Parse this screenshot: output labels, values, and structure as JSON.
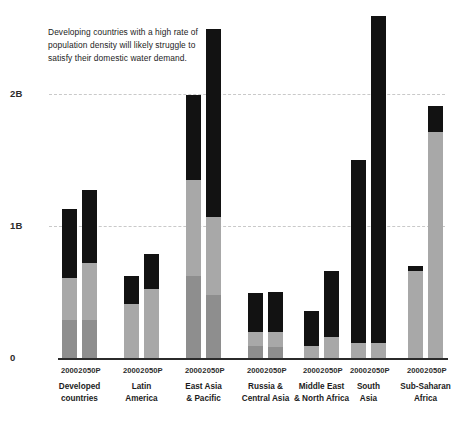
{
  "annotation": {
    "line1": "Developing countries with a high rate of",
    "line2": "population density will likely struggle to",
    "line3": "satisfy their domestic water demand."
  },
  "axis": {
    "y_ticks": [
      "2B",
      "1B",
      "0"
    ],
    "tick_2b": "2B",
    "tick_1b": "1B",
    "tick_0": "0"
  },
  "series_labels": {
    "year_2000": "2000",
    "year_2050": "2050P"
  },
  "chart_data": {
    "type": "bar",
    "subtype": "stacked-grouped",
    "title": "",
    "subtitle": "",
    "annotation": "Developing countries with a high rate of population density will likely struggle to satisfy their domestic water demand.",
    "xlabel": "",
    "ylabel": "",
    "ylim": [
      0,
      2.7
    ],
    "y_unit": "billions",
    "y_tick_values": [
      0,
      1,
      2
    ],
    "y_tick_labels": [
      "0",
      "1B",
      "2B"
    ],
    "grid": "horizontal-dashed",
    "legend": "none",
    "categories": [
      "Developed countries",
      "Latin America",
      "East Asia & Pacific",
      "Russia & Central Asia",
      "Middle East & North Africa",
      "South Asia",
      "Sub-Saharan Africa"
    ],
    "year_groups": [
      "2000",
      "2050P"
    ],
    "stack_segments": [
      "bottom",
      "middle",
      "top"
    ],
    "stack_colors": {
      "bottom": "#8e8e8e",
      "middle": "#a8a8a8",
      "top": "#121212"
    },
    "series": [
      {
        "name": "2000",
        "stacks": [
          {
            "category": "Developed countries",
            "bottom": 0.29,
            "middle": 0.32,
            "top": 0.52,
            "total": 1.13
          },
          {
            "category": "Latin America",
            "bottom": 0.0,
            "middle": 0.41,
            "top": 0.21,
            "total": 0.62
          },
          {
            "category": "East Asia & Pacific",
            "bottom": 0.62,
            "middle": 0.73,
            "top": 0.64,
            "total": 1.99
          },
          {
            "category": "Russia & Central Asia",
            "bottom": 0.09,
            "middle": 0.11,
            "top": 0.29,
            "total": 0.49
          },
          {
            "category": "Middle East & North Africa",
            "bottom": 0.0,
            "middle": 0.09,
            "top": 0.27,
            "total": 0.36
          },
          {
            "category": "South Asia",
            "bottom": 0.0,
            "middle": 0.11,
            "top": 1.39,
            "total": 1.5
          },
          {
            "category": "Sub-Saharan Africa",
            "bottom": 0.0,
            "middle": 0.66,
            "top": 0.04,
            "total": 0.7
          }
        ]
      },
      {
        "name": "2050P",
        "stacks": [
          {
            "category": "Developed countries",
            "bottom": 0.29,
            "middle": 0.43,
            "top": 0.55,
            "total": 1.27
          },
          {
            "category": "Latin America",
            "bottom": 0.0,
            "middle": 0.52,
            "top": 0.27,
            "total": 0.79
          },
          {
            "category": "East Asia & Pacific",
            "bottom": 0.48,
            "middle": 0.59,
            "top": 1.42,
            "total": 2.49
          },
          {
            "category": "Russia & Central Asia",
            "bottom": 0.08,
            "middle": 0.12,
            "top": 0.3,
            "total": 0.5
          },
          {
            "category": "Middle East & North Africa",
            "bottom": 0.0,
            "middle": 0.16,
            "top": 0.5,
            "total": 0.66
          },
          {
            "category": "South Asia",
            "bottom": 0.0,
            "middle": 0.11,
            "top": 2.48,
            "total": 2.59
          },
          {
            "category": "Sub-Saharan Africa",
            "bottom": 0.0,
            "middle": 1.71,
            "top": 0.2,
            "total": 1.91
          }
        ]
      }
    ]
  },
  "groups": [
    {
      "label_line1": "Developed",
      "label_line2": "countries",
      "tick1": "2000",
      "tick2": "2050P"
    },
    {
      "label_line1": "Latin",
      "label_line2": "America",
      "tick1": "2000",
      "tick2": "2050P"
    },
    {
      "label_line1": "East Asia",
      "label_line2": "& Pacific",
      "tick1": "2000",
      "tick2": "2050P"
    },
    {
      "label_line1": "Russia &",
      "label_line2": "Central Asia",
      "tick1": "2000",
      "tick2": "2050P"
    },
    {
      "label_line1": "Middle East",
      "label_line2": "& North Africa",
      "tick1": "2000",
      "tick2": "2050P"
    },
    {
      "label_line1": "South",
      "label_line2": "Asia",
      "tick1": "2000",
      "tick2": "2050P"
    },
    {
      "label_line1": "Sub-Saharan",
      "label_line2": "Africa",
      "tick1": "2000",
      "tick2": "2050P"
    }
  ]
}
